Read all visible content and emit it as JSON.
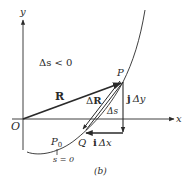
{
  "figure": {
    "caption": "(b)",
    "axes": {
      "x_label": "x",
      "y_label": "y",
      "origin_label": "O"
    },
    "region_note": "Δs < 0",
    "points": {
      "P": {
        "label": "P"
      },
      "Q": {
        "label": "Q"
      },
      "P0": {
        "label": "P",
        "subscript": "0"
      }
    },
    "vectors": {
      "R": {
        "label": "R"
      },
      "delta_R": {
        "prefix": "Δ",
        "label": "R"
      },
      "j_delta_y": {
        "unit": "j",
        "text": "Δy"
      },
      "i_delta_x": {
        "unit": "i",
        "text": "Δx"
      }
    },
    "arc_label": "Δs",
    "start_condition": "s = 0",
    "colors": {
      "ink": "#2a2a2a",
      "background": "#ffffff"
    }
  }
}
